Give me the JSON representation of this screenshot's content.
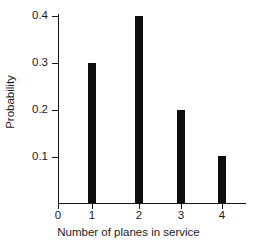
{
  "chart_data": {
    "type": "bar",
    "title": "",
    "xlabel": "Number of planes in service",
    "ylabel": "Probability",
    "categories": [
      "0",
      "1",
      "2",
      "3",
      "4"
    ],
    "x": [
      0,
      1,
      2,
      3,
      4
    ],
    "values": [
      0,
      0.3,
      0.4,
      0.2,
      0.1
    ],
    "bars": [
      {
        "category": "1",
        "x": 1,
        "value": 0.3
      },
      {
        "category": "2",
        "x": 2,
        "value": 0.4
      },
      {
        "category": "3",
        "x": 3,
        "value": 0.2
      },
      {
        "category": "4",
        "x": 4,
        "value": 0.1
      }
    ],
    "xlim": [
      0,
      4.6
    ],
    "ylim": [
      0,
      0.42
    ],
    "xticks": [
      "0",
      "1",
      "2",
      "3",
      "4"
    ],
    "yticks": [
      "0.1",
      "0.2",
      "0.3",
      "0.4"
    ],
    "ytick_values": [
      0.1,
      0.2,
      0.3,
      0.4
    ],
    "grid": false,
    "legend": null,
    "bar_color": "#0d0d0d",
    "axis_color": "#141414",
    "background_color": "#ffffff"
  },
  "axes": {
    "y_labels": [
      "0.4",
      "0.3",
      "0.2",
      "0.1"
    ],
    "x_labels": [
      "0",
      "1",
      "2",
      "3",
      "4"
    ],
    "x_title": "Number of planes in service",
    "y_title": "Probability"
  }
}
